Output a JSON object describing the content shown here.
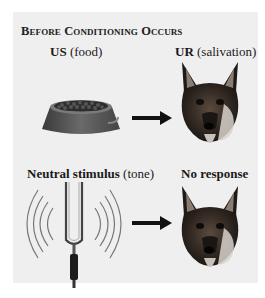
{
  "diagram": {
    "title": "Before Conditioning Occurs",
    "rows": [
      {
        "stimulus": {
          "term": "US",
          "detail": "(food)",
          "icon": "food-bowl-icon"
        },
        "response": {
          "term": "UR",
          "detail": "(salivation)",
          "icon": "dog-head-icon"
        },
        "connector": "right-arrow"
      },
      {
        "stimulus": {
          "term": "Neutral stimulus",
          "detail": "(tone)",
          "icon": "tuning-fork-icon"
        },
        "response": {
          "term": "No response",
          "detail": "",
          "icon": "dog-head-icon"
        },
        "connector": "right-arrow"
      }
    ],
    "colors": {
      "panel_background": "#efefef",
      "page_background": "#ffffff",
      "text": "#1a1a1a",
      "arrow": "#111111"
    }
  }
}
